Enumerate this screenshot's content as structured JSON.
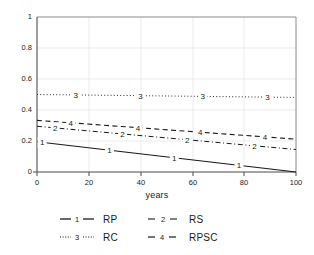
{
  "chart_data": {
    "type": "line",
    "title": "",
    "xlabel": "years",
    "ylabel": "",
    "xlim": [
      0,
      100
    ],
    "ylim": [
      0,
      1
    ],
    "xticks": [
      "0",
      "20",
      "40",
      "60",
      "80",
      "100"
    ],
    "yticks": [
      "0",
      "0.2",
      "0.4",
      "0.6",
      "0.8",
      "1"
    ],
    "grid": true,
    "legend_position": "below",
    "x": [
      0,
      100
    ],
    "series": [
      {
        "name": "RP",
        "marker_label": "1",
        "style": "solid",
        "color": "#1a1a1a",
        "values": [
          0.195,
          0.0
        ],
        "marker_x": [
          2,
          28,
          53,
          78
        ]
      },
      {
        "name": "RS",
        "marker_label": "2",
        "style": "dash-dot",
        "color": "#1a1a1a",
        "values": [
          0.295,
          0.145
        ],
        "marker_x": [
          7,
          33,
          58,
          84
        ]
      },
      {
        "name": "RC",
        "marker_label": "3",
        "style": "dotted",
        "color": "#1a1a1a",
        "values": [
          0.5,
          0.481
        ],
        "marker_x": [
          15,
          40,
          64,
          89
        ]
      },
      {
        "name": "RPSC",
        "marker_label": "4",
        "style": "dashed",
        "color": "#1a1a1a",
        "values": [
          0.333,
          0.212
        ],
        "marker_x": [
          13,
          39,
          63,
          88
        ]
      }
    ]
  },
  "axis": {
    "x_title": "years",
    "x_tick_labels": [
      "0",
      "20",
      "40",
      "60",
      "80",
      "100"
    ],
    "y_tick_labels": [
      "0",
      "0.2",
      "0.4",
      "0.6",
      "0.8",
      "1"
    ]
  },
  "legend": {
    "entries": [
      {
        "marker": "1",
        "label": "RP"
      },
      {
        "marker": "2",
        "label": "RS"
      },
      {
        "marker": "3",
        "label": "RC"
      },
      {
        "marker": "4",
        "label": "RPSC"
      }
    ]
  }
}
